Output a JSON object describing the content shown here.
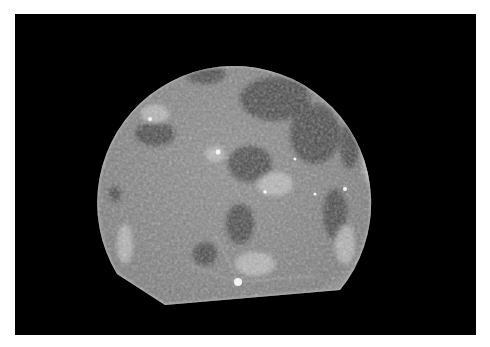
{
  "image": {
    "subject": "moon",
    "description": "Grayscale photograph of the full Moon against a black background, bottom edge cropped flat",
    "colors": {
      "background": "#000000",
      "border": "#ffffff",
      "surface_base": "#8a8a8a",
      "maria": "#3a3a3a",
      "highlands": "#c8c8c8"
    }
  }
}
